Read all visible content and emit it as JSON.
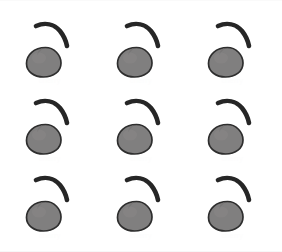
{
  "page": {
    "background_color": "#ffffff",
    "width": 282,
    "height": 252
  },
  "grid": {
    "rows": 3,
    "columns": 3,
    "total_items": 9,
    "item_label": "cherry"
  },
  "icon": {
    "name": "cherry-icon",
    "body_fill": "#807f7f",
    "body_stroke": "#2e2e2e",
    "stem_color": "#262626",
    "highlight": "#8e8d8d",
    "shadow": "#6f6e6e"
  },
  "items": [
    {
      "index": 1,
      "row": 1,
      "column": 1,
      "label": "cherry"
    },
    {
      "index": 2,
      "row": 1,
      "column": 2,
      "label": "cherry"
    },
    {
      "index": 3,
      "row": 1,
      "column": 3,
      "label": "cherry"
    },
    {
      "index": 4,
      "row": 2,
      "column": 1,
      "label": "cherry"
    },
    {
      "index": 5,
      "row": 2,
      "column": 2,
      "label": "cherry"
    },
    {
      "index": 6,
      "row": 2,
      "column": 3,
      "label": "cherry"
    },
    {
      "index": 7,
      "row": 3,
      "column": 1,
      "label": "cherry"
    },
    {
      "index": 8,
      "row": 3,
      "column": 2,
      "label": "cherry"
    },
    {
      "index": 9,
      "row": 3,
      "column": 3,
      "label": "cherry"
    }
  ]
}
